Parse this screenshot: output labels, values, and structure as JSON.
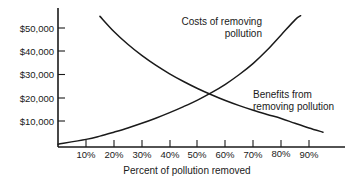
{
  "chart_data": {
    "type": "line",
    "title": "",
    "xlabel": "Percent  of pollution removed",
    "ylabel": "",
    "xlim": [
      0,
      100
    ],
    "ylim": [
      0,
      60000
    ],
    "grid": false,
    "legend_position": "inline-annotations",
    "xticks": [
      "10%",
      "20%",
      "30%",
      "40%",
      "50%",
      "60%",
      "70%",
      "80%",
      "90%"
    ],
    "xtick_values": [
      10,
      20,
      30,
      40,
      50,
      60,
      70,
      80,
      90
    ],
    "yticks": [
      "$10,000",
      "$20,000",
      "$30,000",
      "$40,000",
      "$50,000"
    ],
    "ytick_values": [
      10000,
      20000,
      30000,
      40000,
      50000
    ],
    "series": [
      {
        "name": "Costs of removing pollution",
        "label_line1": "Costs of removing",
        "label_line2": "pollution",
        "shape": "decreasing-convex",
        "x": [
          15,
          20,
          25,
          30,
          35,
          40,
          45,
          50,
          55,
          60,
          65,
          70,
          75,
          80,
          85,
          90,
          95
        ],
        "values": [
          55000,
          48500,
          43000,
          38200,
          34000,
          30300,
          27000,
          24000,
          21300,
          18800,
          16600,
          14600,
          12800,
          11100,
          9000,
          7000,
          5200
        ]
      },
      {
        "name": "Benefits from removing pollution",
        "label_line1": "Benefits from",
        "label_line2": "removing pollution",
        "shape": "increasing-convex",
        "x": [
          0,
          10,
          15,
          20,
          25,
          30,
          35,
          40,
          45,
          50,
          55,
          60,
          65,
          70,
          75,
          80,
          85,
          87
        ],
        "values": [
          0,
          2100,
          3500,
          5200,
          7000,
          9000,
          11200,
          13600,
          16200,
          19000,
          22200,
          25800,
          30000,
          34800,
          40500,
          47000,
          53500,
          55300
        ]
      }
    ],
    "intersection": {
      "x": 53,
      "y": 21500
    },
    "colors": {
      "axis": "#1a1a1a",
      "curve": "#1a1a1a",
      "background": "#ffffff"
    }
  }
}
